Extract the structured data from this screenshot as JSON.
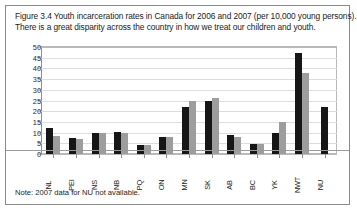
{
  "figure": {
    "caption_line1": "Figure 3.4 Youth incarceration rates in Canada for 2006 and 2007 (per 10,000 young persons).",
    "caption_line2": "There is a great disparity across the country in how we treat our children and youth.",
    "note": "Note: 2007 data for NU not available."
  },
  "chart_data": {
    "type": "bar",
    "title": "Figure 3.4 Youth incarceration rates in Canada for 2006 and 2007 (per 10,000 young persons).",
    "subtitle": "There is a great disparity across the country in how we treat our children and youth.",
    "xlabel": "",
    "ylabel": "",
    "ylim": [
      0,
      50
    ],
    "yticks": [
      0,
      5,
      10,
      15,
      20,
      25,
      30,
      35,
      40,
      45,
      50
    ],
    "grid": true,
    "legend": false,
    "categories": [
      "NL",
      "PEI",
      "NS",
      "NB",
      "PQ",
      "ON",
      "MN",
      "SK",
      "AB",
      "BC",
      "YK",
      "NWT",
      "NU"
    ],
    "series": [
      {
        "name": "2006",
        "color": "#161616",
        "values": [
          12,
          7.5,
          10,
          10.5,
          4,
          8,
          22,
          25,
          9,
          4.5,
          10,
          47,
          22
        ]
      },
      {
        "name": "2007",
        "color": "#9d9d9d",
        "values": [
          8.5,
          7,
          10,
          10,
          4,
          8,
          25,
          26,
          8,
          4.5,
          15,
          38,
          null
        ]
      }
    ],
    "note": "Note: 2007 data for NU not available."
  }
}
